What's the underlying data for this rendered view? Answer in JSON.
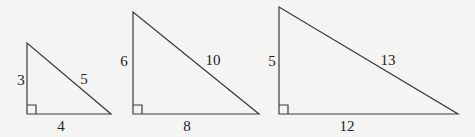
{
  "diagram": {
    "title": "",
    "line_color": "#3a3a3a",
    "background": "#f4f4f2",
    "triangles": [
      {
        "id": "triangle-3-4-5",
        "vertices": {
          "top": [
            27,
            43
          ],
          "right_angle": [
            27,
            114
          ],
          "right": [
            111,
            114
          ]
        },
        "labels": {
          "vertical_leg": "3",
          "hypotenuse": "5",
          "horizontal_leg": "4"
        }
      },
      {
        "id": "triangle-6-8-10",
        "vertices": {
          "top": [
            133,
            12
          ],
          "right_angle": [
            133,
            114
          ],
          "right": [
            259,
            114
          ]
        },
        "labels": {
          "vertical_leg": "6",
          "hypotenuse": "10",
          "horizontal_leg": "8"
        }
      },
      {
        "id": "triangle-5-12-13",
        "vertices": {
          "top": [
            279,
            7
          ],
          "right_angle": [
            279,
            114
          ],
          "right": [
            458,
            114
          ]
        },
        "labels": {
          "vertical_leg": "5",
          "hypotenuse": "13",
          "horizontal_leg": "12"
        }
      }
    ]
  }
}
